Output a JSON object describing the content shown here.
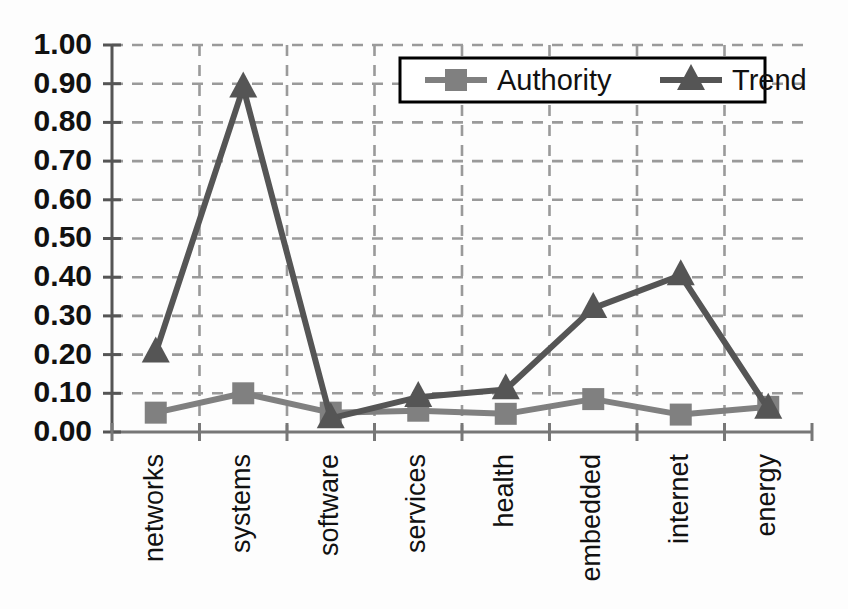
{
  "chart_data": {
    "type": "line",
    "title": "",
    "xlabel": "",
    "ylabel": "",
    "categories": [
      "networks",
      "systems",
      "software",
      "services",
      "health",
      "embedded",
      "internet",
      "energy"
    ],
    "series": [
      {
        "name": "Authority",
        "marker": "square",
        "color": "#808080",
        "values": [
          0.05,
          0.1,
          0.05,
          0.055,
          0.047,
          0.085,
          0.045,
          0.065
        ]
      },
      {
        "name": "Trend",
        "marker": "triangle",
        "color": "#555555",
        "values": [
          0.205,
          0.89,
          0.035,
          0.09,
          0.11,
          0.32,
          0.405,
          0.06
        ]
      }
    ],
    "ylim": [
      0.0,
      1.0
    ],
    "ytick_step": 0.1,
    "ytick_labels": [
      "0.00",
      "0.10",
      "0.20",
      "0.30",
      "0.40",
      "0.50",
      "0.60",
      "0.70",
      "0.80",
      "0.90",
      "1.00"
    ],
    "grid": true,
    "grid_style": "dashed",
    "grid_color": "#9a9a9a",
    "legend_position": "top-right",
    "axis_color": "#555555",
    "background": "#fdfdfd"
  },
  "legend": {
    "entries": [
      {
        "label": "Authority",
        "marker": "square-marker-icon"
      },
      {
        "label": "Trend",
        "marker": "triangle-marker-icon"
      }
    ]
  }
}
